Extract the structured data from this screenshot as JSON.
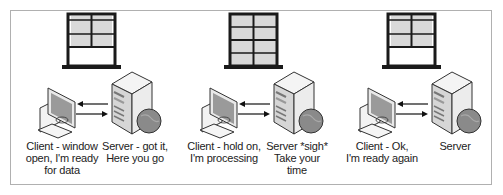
{
  "diagram": {
    "type": "client-server flow control illustration",
    "colors": {
      "frame_border": "#b0b0b0",
      "window_frame": "#1a1a1a",
      "window_pane": "#d9d9d9",
      "device_body": "#e6e6e6",
      "device_outline": "#333333",
      "globe": "#8a8a8a",
      "arrow": "#111111"
    },
    "panels": [
      {
        "window_state": "open",
        "client_caption": [
          "Client - window",
          "open, I'm ready",
          "for data"
        ],
        "server_caption": [
          "Server - got it,",
          "Here you go"
        ]
      },
      {
        "window_state": "closed",
        "client_caption": [
          "Client - hold on,",
          "I'm processing"
        ],
        "server_caption": [
          "Server *sigh*",
          "Take your time"
        ]
      },
      {
        "window_state": "open",
        "client_caption": [
          "Client - Ok,",
          "I'm ready again"
        ],
        "server_caption": [
          "Server"
        ]
      }
    ]
  }
}
